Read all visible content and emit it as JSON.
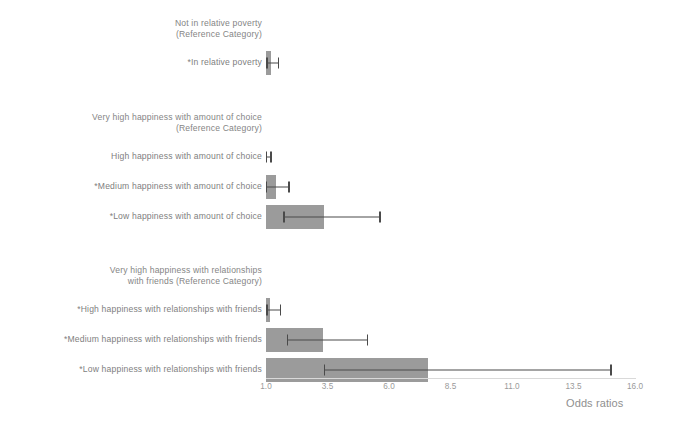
{
  "chart_data": {
    "type": "bar",
    "orientation": "horizontal",
    "title": "",
    "xlabel": "Odds ratios",
    "ylabel": "",
    "xlim": [
      1.0,
      16.0
    ],
    "xticks": [
      "1.0",
      "3.5",
      "6.0",
      "8.5",
      "11.0",
      "13.5",
      "16.0"
    ],
    "xtick_values": [
      1.0,
      3.5,
      6.0,
      8.5,
      11.0,
      13.5,
      16.0
    ],
    "grid": false,
    "legend": null,
    "baseline": 1.0,
    "bar_color": "#9b9b9b",
    "error_color": "#4a4a4a",
    "groups": [
      {
        "name": "relative-poverty",
        "reference_label": "Not in relative poverty\n(Reference Category)",
        "rows": [
          {
            "label": "*In relative poverty",
            "value": 1.22,
            "ci_low": 1.02,
            "ci_high": 1.48,
            "significant": true
          }
        ]
      },
      {
        "name": "happiness-with-amount-of-choice",
        "reference_label": "Very high happiness with amount of choice\n(Reference Category)",
        "rows": [
          {
            "label": "High happiness with amount of choice",
            "value": 1.0,
            "ci_low": 1.0,
            "ci_high": 1.17,
            "significant": false
          },
          {
            "label": "*Medium happiness with amount of choice",
            "value": 1.4,
            "ci_low": 1.0,
            "ci_high": 1.9,
            "significant": true
          },
          {
            "label": "*Low happiness with amount of choice",
            "value": 3.35,
            "ci_low": 1.7,
            "ci_high": 5.6,
            "significant": true
          }
        ]
      },
      {
        "name": "happiness-with-relationships-with-friends",
        "reference_label": "Very high happiness with relationships\nwith friends (Reference Category)",
        "rows": [
          {
            "label": "*High happiness with relationships with friends",
            "value": 1.15,
            "ci_low": 1.02,
            "ci_high": 1.55,
            "significant": true
          },
          {
            "label": "*Medium happiness with relationships with friends",
            "value": 3.3,
            "ci_low": 1.85,
            "ci_high": 5.1,
            "significant": true
          },
          {
            "label": "*Low happiness with relationships with friends",
            "value": 7.6,
            "ci_low": 3.35,
            "ci_high": 15.0,
            "significant": true
          }
        ]
      }
    ]
  }
}
